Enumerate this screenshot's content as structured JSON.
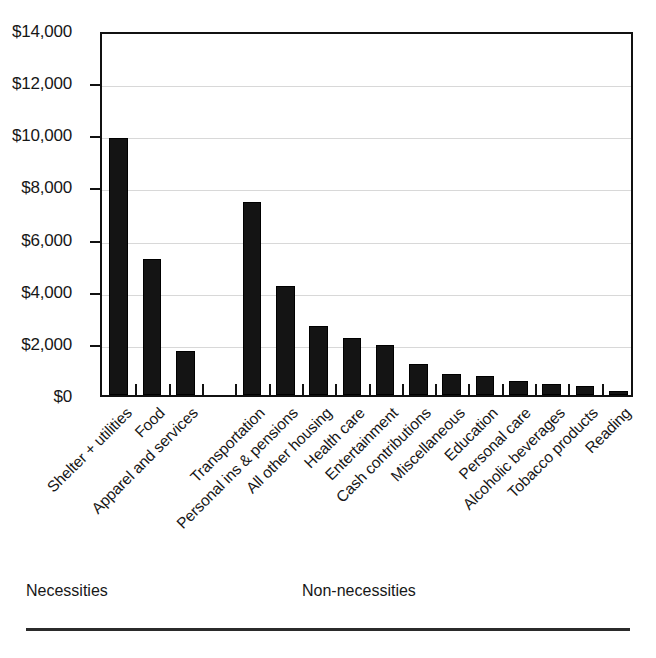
{
  "chart_data": {
    "type": "bar",
    "title": "",
    "subtitle": "",
    "xlabel": "",
    "ylabel": "",
    "ylim": [
      0,
      14000
    ],
    "ytick_labels": [
      "$0",
      "$2,000",
      "$4,000",
      "$6,000",
      "$8,000",
      "$10,000",
      "$12,000",
      "$14,000"
    ],
    "ytick_values": [
      0,
      2000,
      4000,
      6000,
      8000,
      10000,
      12000,
      14000
    ],
    "grid": true,
    "legend": "none",
    "categories": [
      "Shelter + utilities",
      "Food",
      "Apparel and services",
      "Transportation",
      "Personal ins & pensions",
      "All other housing",
      "Health care",
      "Entertainment",
      "Cash contributions",
      "Miscellaneous",
      "Education",
      "Personal care",
      "Alcoholic beverages",
      "Tobacco products",
      "Reading"
    ],
    "values": [
      9850,
      5200,
      1700,
      7400,
      4200,
      2650,
      2200,
      1900,
      1200,
      800,
      740,
      540,
      420,
      330,
      140
    ],
    "groups": [
      {
        "label": "Necessities",
        "categories": [
          "Shelter + utilities",
          "Food",
          "Apparel and services"
        ]
      },
      {
        "label": "Non-necessities",
        "categories": [
          "Transportation",
          "Personal ins & pensions",
          "All other housing",
          "Health care",
          "Entertainment",
          "Cash contributions",
          "Miscellaneous",
          "Education",
          "Personal care",
          "Alcoholic beverages",
          "Tobacco products",
          "Reading"
        ]
      }
    ],
    "bar_color": "#141414",
    "axis_color": "#111111",
    "gridline_color": "#d8d8d8"
  },
  "annotations": {
    "necessities": "Necessities",
    "non_necessities": "Non-necessities"
  }
}
